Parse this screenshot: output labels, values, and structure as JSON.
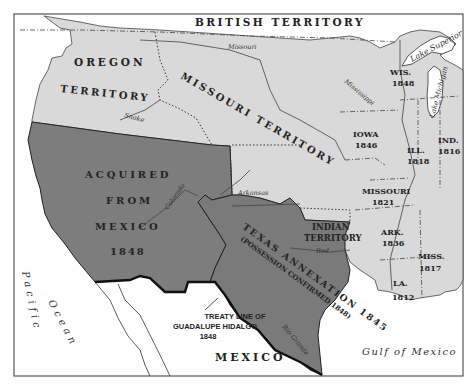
{
  "map": {
    "colors": {
      "background": "#ffffff",
      "us_states_territories": "#d9d9d9",
      "mexican_cession": "#7d7d7d",
      "texas_annexation": "#7a7a7a",
      "frame": "#555555",
      "text": "#222222"
    },
    "regions": {
      "british_territory": "BRITISH TERRITORY",
      "oregon_1": "OREGON",
      "oregon_2": "TERRITORY",
      "missouri_territory": "MISSOURI TERRITORY",
      "acquired_1": "ACQUIRED",
      "acquired_2": "FROM",
      "acquired_3": "MEXICO",
      "acquired_4": "1848",
      "texas_1": "TEXAS ANNEXATION 1845",
      "texas_2": "(POSSESSION CONFIRMED 1848)",
      "indian_1": "INDIAN",
      "indian_2": "TERRITORY",
      "mexico": "MEXICO"
    },
    "states": [
      {
        "name": "WIS.",
        "year": "1848"
      },
      {
        "name": "IOWA",
        "year": "1846"
      },
      {
        "name": "ILL.",
        "year": "1818"
      },
      {
        "name": "IND.",
        "year": "1816"
      },
      {
        "name": "MISSOURI",
        "year": "1821"
      },
      {
        "name": "ARK.",
        "year": "1836"
      },
      {
        "name": "MISS.",
        "year": "1817"
      },
      {
        "name": "LA.",
        "year": "1812"
      }
    ],
    "water": {
      "pacific_1": "Pacific",
      "pacific_2": "Ocean",
      "gulf": "Gulf of Mexico",
      "lake_superior": "Lake Superior",
      "lake_michigan": "Lake Michigan"
    },
    "rivers": {
      "missouri": "Missouri",
      "mississippi": "Mississippi",
      "snake": "Snake",
      "colorado": "Colorado",
      "arkansas": "Arkansas",
      "red": "Red",
      "rio_grande": "Rio Grande",
      "r_abbrev": "R."
    },
    "annotation": {
      "line1": "TREATY LINE OF",
      "line2": "GUADALUPE HIDALGO",
      "line3": "1848"
    }
  }
}
